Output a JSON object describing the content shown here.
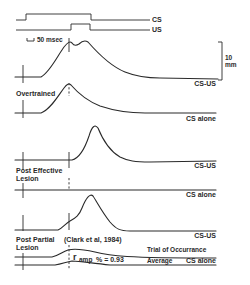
{
  "figure": {
    "stimulus": {
      "cs_label": "CS",
      "us_label": "US"
    },
    "time_scale": {
      "label": "50 msec"
    },
    "amplitude_scale": {
      "value": "10",
      "unit": "mm"
    },
    "panels": [
      {
        "group_label": "",
        "trace_label": "CS-US",
        "description": "Normal conditioned response with double peak around US onset"
      },
      {
        "group_label": "Overtrained",
        "trace_label": "CS alone",
        "description": "Response peaks at US onset then decays"
      },
      {
        "group_label": "",
        "trace_label": "CS-US",
        "description": "Post effective lesion: only unconditioned response after US onset"
      },
      {
        "group_label": "Post Effective Lesion",
        "group_label_line1": "Post Effective",
        "group_label_line2": "Lesion",
        "trace_label": "CS alone",
        "description": "Flat trace, no response"
      },
      {
        "group_label": "",
        "trace_label": "CS-US",
        "description": "Post partial lesion: small CR shoulder then UR peak"
      },
      {
        "group_label": "Post Partial Lesion",
        "group_label_line1": "Post Partial",
        "group_label_line2": "Lesion",
        "trace_label": "CS alone",
        "citation": "(Clark et al, 1984)",
        "overlay_labels": {
          "trial": "Trial of Occurrance",
          "average": "Average"
        },
        "stat": {
          "symbol": "r",
          "subscript": "amp",
          "expression": "% = 0.93"
        }
      }
    ],
    "colors": {
      "ink": "#2a2a2a",
      "background": "#ffffff"
    }
  }
}
